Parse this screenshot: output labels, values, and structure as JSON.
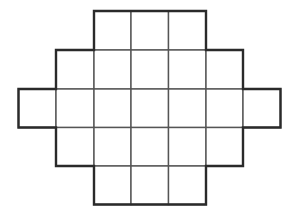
{
  "figure": {
    "type": "grid-shape",
    "rows": 5,
    "columns": 7,
    "row_cells": [
      {
        "row": 0,
        "start_col": 2,
        "end_col": 4,
        "count": 3
      },
      {
        "row": 1,
        "start_col": 1,
        "end_col": 5,
        "count": 5
      },
      {
        "row": 2,
        "start_col": 0,
        "end_col": 6,
        "count": 7
      },
      {
        "row": 3,
        "start_col": 1,
        "end_col": 5,
        "count": 5
      },
      {
        "row": 4,
        "start_col": 2,
        "end_col": 4,
        "count": 3
      }
    ],
    "total_cells": 23,
    "colors": {
      "outline": "#2a2a2a",
      "inner_lines": "#555555",
      "fill": "#ffffff",
      "background": "#ffffff"
    },
    "geometry": {
      "x_lines": [
        18.5,
        56,
        94,
        131,
        168.5,
        206,
        243,
        280.5
      ],
      "y_lines": [
        11,
        50,
        89,
        127.5,
        166,
        204.5
      ]
    }
  }
}
